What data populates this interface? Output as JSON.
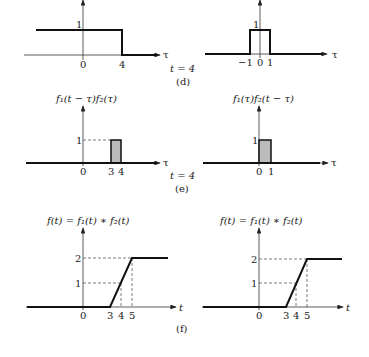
{
  "panels": {
    "d": {
      "caption": "(d)",
      "time_label": "t = 4",
      "left": {
        "y_tick": "1",
        "x_ticks": [
          "0",
          "4"
        ],
        "axis_label": "τ"
      },
      "right": {
        "y_tick": "1",
        "x_ticks": [
          "−1",
          "0",
          "1"
        ],
        "axis_label": "τ"
      }
    },
    "e": {
      "caption": "(e)",
      "time_label": "t = 4",
      "left": {
        "title": "f₁(t − τ)f₂(τ)",
        "y_tick": "1",
        "x_ticks": [
          "0",
          "3",
          "4"
        ],
        "axis_label": "τ"
      },
      "right": {
        "title": "f₁(τ)f₂(t − τ)",
        "y_tick": "1",
        "x_ticks": [
          "0",
          "1"
        ],
        "axis_label": "τ"
      }
    },
    "f": {
      "caption": "(f)",
      "left": {
        "title": "f(t) = f₁(t) ∗ f₂(t)",
        "y_ticks": [
          "1",
          "2"
        ],
        "x_ticks": [
          "0",
          "3",
          "4",
          "5"
        ],
        "axis_label": "t"
      },
      "right": {
        "title": "f(t) = f₁(t) ∗ f₂(t)",
        "y_ticks": [
          "1",
          "2"
        ],
        "x_ticks": [
          "0",
          "3",
          "4",
          "5"
        ],
        "axis_label": "t"
      }
    }
  }
}
